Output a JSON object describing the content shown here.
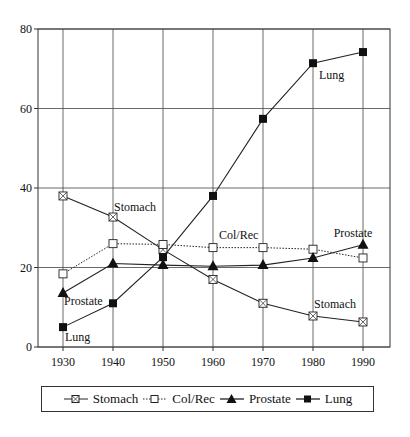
{
  "chart_data": {
    "type": "line",
    "title": "",
    "xlabel": "",
    "ylabel": "",
    "x": [
      1930,
      1940,
      1950,
      1960,
      1970,
      1980,
      1990
    ],
    "xticks": [
      "1930",
      "1940",
      "1950",
      "1960",
      "1970",
      "1980",
      "1990"
    ],
    "yticks": [
      "0",
      "20",
      "40",
      "60",
      "80"
    ],
    "ylim": [
      0,
      80
    ],
    "xlim": [
      1925,
      1995
    ],
    "grid": true,
    "legend_position": "bottom",
    "series": [
      {
        "name": "Stomach",
        "marker": "crossed-square",
        "line": "solid",
        "values": [
          38,
          32.7,
          24.5,
          17,
          11,
          7.8,
          6.3
        ]
      },
      {
        "name": "Col/Rec",
        "marker": "open-square",
        "line": "dotted",
        "values": [
          18.4,
          26,
          25.8,
          25,
          25,
          24.6,
          22.4
        ]
      },
      {
        "name": "Prostate",
        "marker": "filled-triangle",
        "line": "solid",
        "values": [
          13.6,
          21,
          20.6,
          20.3,
          20.6,
          22.4,
          25.7
        ]
      },
      {
        "name": "Lung",
        "marker": "filled-square",
        "line": "solid",
        "values": [
          5,
          11,
          22.6,
          38,
          57.4,
          71.4,
          74.2
        ]
      }
    ],
    "annotations": [
      {
        "text": "Stomach",
        "x": 1940,
        "y": 32.7
      },
      {
        "text": "Prostate",
        "x": 1930,
        "y": 13.6
      },
      {
        "text": "Lung",
        "x": 1930,
        "y": 5
      },
      {
        "text": "Col/Rec",
        "x": 1960,
        "y": 25
      },
      {
        "text": "Prostate",
        "x": 1990,
        "y": 25.7
      },
      {
        "text": "Stomach",
        "x": 1980,
        "y": 7.8
      },
      {
        "text": "Lung",
        "x": 1980,
        "y": 71.4
      }
    ]
  },
  "legend": {
    "items": [
      {
        "label": "Stomach"
      },
      {
        "label": "Col/Rec"
      },
      {
        "label": "Prostate"
      },
      {
        "label": "Lung"
      }
    ]
  }
}
